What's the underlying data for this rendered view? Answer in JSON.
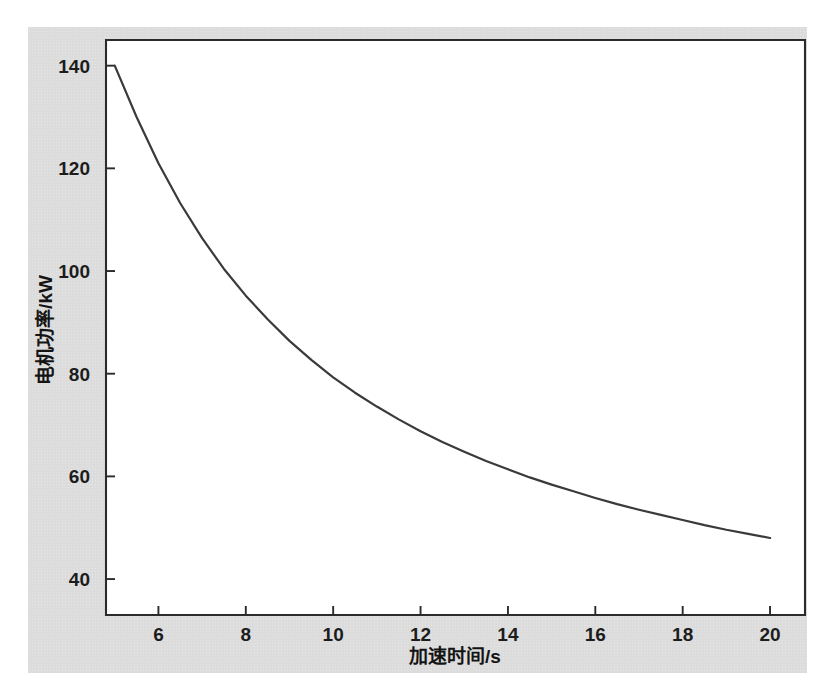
{
  "figure": {
    "background_color": "#dcdcdc",
    "page_color": "#ffffff",
    "axis_color": "#2b2b2b",
    "curve_color": "#3a3a3a"
  },
  "chart_data": {
    "type": "line",
    "title": "",
    "xlabel": "加速时间/s",
    "ylabel": "电机功率/kW",
    "xlim": [
      4.8,
      20.8
    ],
    "ylim": [
      33,
      145
    ],
    "xticks": [
      6,
      8,
      10,
      12,
      14,
      16,
      18,
      20
    ],
    "yticks": [
      40,
      60,
      80,
      100,
      120,
      140
    ],
    "xtick_labels": [
      "6",
      "8",
      "10",
      "12",
      "14",
      "16",
      "18",
      "20"
    ],
    "ytick_labels": [
      "40",
      "60",
      "80",
      "100",
      "120",
      "140"
    ],
    "grid": false,
    "legend": null,
    "series": [
      {
        "name": "电机功率",
        "x": [
          5.0,
          5.5,
          6.0,
          6.5,
          7.0,
          7.5,
          8.0,
          8.5,
          9.0,
          9.5,
          10.0,
          10.5,
          11.0,
          11.5,
          12.0,
          12.5,
          13.0,
          13.5,
          14.0,
          14.5,
          15.0,
          15.5,
          16.0,
          16.5,
          17.0,
          17.5,
          18.0,
          18.5,
          19.0,
          19.5,
          20.0
        ],
        "y": [
          140.0,
          130.0,
          121.0,
          113.2,
          106.4,
          100.4,
          95.2,
          90.6,
          86.4,
          82.7,
          79.3,
          76.3,
          73.6,
          71.1,
          68.8,
          66.7,
          64.8,
          63.0,
          61.4,
          59.8,
          58.4,
          57.1,
          55.8,
          54.6,
          53.5,
          52.5,
          51.5,
          50.5,
          49.6,
          48.8,
          48.0
        ]
      }
    ]
  }
}
